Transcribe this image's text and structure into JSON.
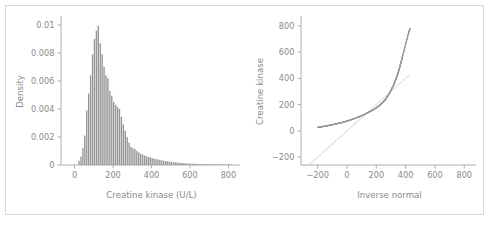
{
  "figure": {
    "background_color": "#ffffff",
    "frame_color": "#d9d9d9",
    "text_color": "#8a8a8a",
    "axis_color": "#9a9a9a",
    "bar_color": "#8c8c8c",
    "point_color": "#9b9b9b",
    "reference_line_color": "#e2e2e2",
    "panel_count": 2
  },
  "chart_data": [
    {
      "type": "bar",
      "panel": "left",
      "title": "",
      "xlabel": "Creatine kinase (U/L)",
      "ylabel": "Density",
      "xlim": [
        -60,
        860
      ],
      "ylim": [
        0,
        0.0105
      ],
      "xticks": [
        0,
        200,
        400,
        600,
        800
      ],
      "xtick_labels": [
        "0",
        "200",
        "400",
        "600",
        "800"
      ],
      "yticks": [
        0,
        0.002,
        0.004,
        0.006,
        0.008,
        0.01
      ],
      "ytick_labels": [
        "0",
        "0.002",
        "0.004",
        "0.006",
        "0.008",
        "0.01"
      ],
      "grid": false,
      "legend": "none",
      "bin_width": 10,
      "bin_starts": [
        20,
        30,
        40,
        50,
        60,
        70,
        80,
        90,
        100,
        110,
        120,
        130,
        140,
        150,
        160,
        170,
        180,
        190,
        200,
        210,
        220,
        230,
        240,
        250,
        260,
        270,
        280,
        290,
        300,
        310,
        320,
        330,
        340,
        350,
        360,
        370,
        380,
        390,
        400,
        410,
        420,
        430,
        440,
        450,
        460,
        470,
        480,
        490,
        500,
        510,
        520,
        530,
        540,
        550,
        560,
        570,
        580,
        590,
        600,
        610,
        620,
        630,
        640,
        650,
        660,
        670,
        680,
        690,
        700,
        710,
        720,
        730,
        740,
        750,
        760,
        770,
        780,
        790,
        800,
        810
      ],
      "values": [
        0.0003,
        0.0006,
        0.0012,
        0.0021,
        0.0039,
        0.0051,
        0.0064,
        0.0079,
        0.009,
        0.0096,
        0.00995,
        0.0087,
        0.0079,
        0.007,
        0.0064,
        0.0062,
        0.0053,
        0.00495,
        0.0045,
        0.0043,
        0.00415,
        0.004,
        0.00345,
        0.0029,
        0.00245,
        0.002,
        0.0016,
        0.0013,
        0.0012,
        0.00115,
        0.001,
        0.0009,
        0.0008,
        0.00075,
        0.00068,
        0.00062,
        0.00058,
        0.00055,
        0.0005,
        0.00045,
        0.00042,
        0.0004,
        0.00036,
        0.00033,
        0.0003,
        0.00028,
        0.00026,
        0.00024,
        0.00022,
        0.0002,
        0.00019,
        0.00018,
        0.00016,
        0.00015,
        0.00014,
        0.00012,
        0.00012,
        0.0001,
        0.0001,
        9e-05,
        8e-05,
        8e-05,
        7e-05,
        6e-05,
        6e-05,
        6e-05,
        5e-05,
        5e-05,
        4e-05,
        4e-05,
        4e-05,
        3e-05,
        3e-05,
        3e-05,
        2e-05,
        2e-05,
        2e-05,
        2e-05,
        2e-05,
        2e-05
      ]
    },
    {
      "type": "scatter",
      "panel": "right",
      "title": "",
      "xlabel": "Inverse normal",
      "ylabel": "Creatine kinase",
      "xlim": [
        -300,
        880
      ],
      "ylim": [
        -260,
        860
      ],
      "xticks": [
        -200,
        0,
        200,
        400,
        600,
        800
      ],
      "xtick_labels": [
        "−200",
        "0",
        "200",
        "400",
        "600",
        "800"
      ],
      "yticks": [
        -200,
        0,
        200,
        400,
        600,
        800
      ],
      "ytick_labels": [
        "−200",
        "0",
        "200",
        "400",
        "600",
        "800"
      ],
      "grid": false,
      "legend": "none",
      "reference_line": {
        "type": "identity",
        "from": [
          -260,
          -260
        ],
        "to": [
          430,
          430
        ]
      },
      "x": [
        -200,
        -180,
        -160,
        -140,
        -120,
        -100,
        -80,
        -60,
        -40,
        -20,
        0,
        20,
        40,
        60,
        80,
        100,
        120,
        140,
        160,
        180,
        200,
        215,
        230,
        245,
        260,
        272,
        284,
        295,
        305,
        315,
        324,
        332,
        340,
        347,
        354,
        360,
        366,
        372,
        378,
        384,
        390,
        396,
        402,
        408,
        414,
        420,
        425,
        430
      ],
      "y": [
        26,
        30,
        34,
        38,
        42,
        47,
        52,
        57,
        62,
        68,
        75,
        82,
        90,
        98,
        107,
        116,
        126,
        137,
        149,
        162,
        176,
        188,
        202,
        218,
        236,
        255,
        276,
        298,
        320,
        342,
        366,
        390,
        414,
        438,
        462,
        487,
        512,
        538,
        564,
        590,
        616,
        642,
        668,
        695,
        720,
        745,
        765,
        782
      ]
    }
  ],
  "left_panel": {
    "xlabel": "Creatine kinase (U/L)",
    "ylabel": "Density"
  },
  "right_panel": {
    "xlabel": "Inverse normal",
    "ylabel": "Creatine kinase"
  }
}
